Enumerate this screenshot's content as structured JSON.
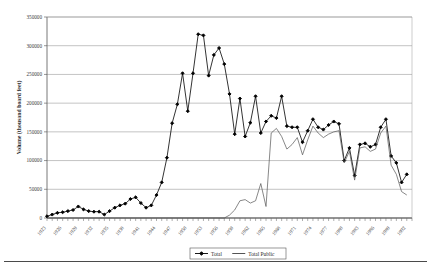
{
  "chart_data": {
    "type": "line",
    "title": "",
    "xlabel": "",
    "ylabel": "Volume (thousand board feet)",
    "ylim": [
      0,
      350000
    ],
    "yticks": [
      0,
      50000,
      100000,
      150000,
      200000,
      250000,
      300000,
      350000
    ],
    "ytick_labels": [
      "0",
      "50000",
      "100000",
      "150000",
      "200000",
      "250000",
      "300000",
      "350000"
    ],
    "grid": true,
    "legend_position": "bottom",
    "x_tick_step_years": 3,
    "x": [
      1923,
      1924,
      1925,
      1926,
      1927,
      1928,
      1929,
      1930,
      1931,
      1932,
      1933,
      1934,
      1935,
      1936,
      1937,
      1938,
      1939,
      1940,
      1941,
      1942,
      1943,
      1944,
      1945,
      1946,
      1947,
      1948,
      1949,
      1950,
      1951,
      1952,
      1953,
      1954,
      1955,
      1956,
      1957,
      1958,
      1959,
      1960,
      1961,
      1962,
      1963,
      1964,
      1965,
      1966,
      1967,
      1968,
      1969,
      1970,
      1971,
      1972,
      1973,
      1974,
      1975,
      1976,
      1977,
      1978,
      1979,
      1980,
      1981,
      1982,
      1983,
      1984,
      1985,
      1986,
      1987,
      1988,
      1989,
      1990,
      1991,
      1992,
      1993
    ],
    "xtick_labels": [
      "1923",
      "1926",
      "1929",
      "1932",
      "1935",
      "1938",
      "1941",
      "1944",
      "1947",
      "1950",
      "1953",
      "1956",
      "1959",
      "1962",
      "1965",
      "1968",
      "1971",
      "1974",
      "1977",
      "1980",
      "1983",
      "1986",
      "1989",
      "1992"
    ],
    "series": [
      {
        "name": "Total",
        "marker": "diamond",
        "color": "#000000",
        "values": [
          3000,
          6000,
          9000,
          10000,
          12000,
          14000,
          20000,
          15000,
          12000,
          11000,
          11000,
          6000,
          12000,
          18000,
          22000,
          25000,
          33000,
          36000,
          26000,
          18000,
          22000,
          40000,
          62000,
          105000,
          165000,
          198000,
          252000,
          186000,
          252000,
          320000,
          318000,
          248000,
          284000,
          296000,
          268000,
          216000,
          146000,
          208000,
          142000,
          166000,
          212000,
          148000,
          168000,
          178000,
          174000,
          212000,
          160000,
          158000,
          158000,
          132000,
          152000,
          172000,
          158000,
          154000,
          162000,
          168000,
          164000,
          100000,
          122000,
          74000,
          128000,
          130000,
          124000,
          128000,
          158000,
          172000,
          108000,
          96000,
          62000,
          76000,
          null
        ]
      },
      {
        "name": "Total Public",
        "marker": "none",
        "color": "#555555",
        "values": [
          0,
          0,
          0,
          0,
          0,
          0,
          0,
          0,
          0,
          0,
          0,
          0,
          0,
          0,
          0,
          0,
          0,
          0,
          0,
          0,
          0,
          0,
          0,
          0,
          0,
          0,
          0,
          0,
          0,
          0,
          0,
          0,
          0,
          0,
          0,
          5000,
          14000,
          30000,
          32000,
          26000,
          30000,
          60000,
          20000,
          148000,
          156000,
          142000,
          120000,
          128000,
          140000,
          110000,
          136000,
          160000,
          148000,
          140000,
          146000,
          150000,
          152000,
          96000,
          116000,
          66000,
          122000,
          124000,
          116000,
          120000,
          148000,
          160000,
          92000,
          76000,
          46000,
          40000,
          null
        ]
      }
    ],
    "legend": [
      {
        "label": "Total",
        "marker": "diamond"
      },
      {
        "label": "Total Public",
        "marker": "none"
      }
    ]
  }
}
